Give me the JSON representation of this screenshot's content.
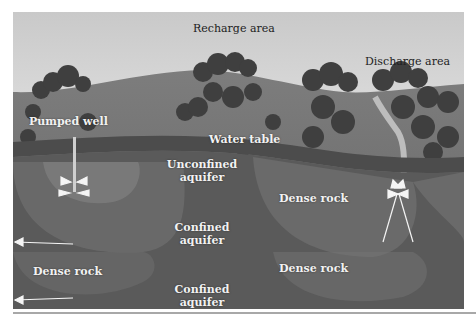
{
  "diagram": {
    "style": "grayscale illustration",
    "labels": {
      "recharge_area": "Recharge area",
      "discharge_area": "Discharge area",
      "pumped_well": "Pumped well",
      "water_table": "Water table",
      "unconfined_aquifer_line1": "Unconfined",
      "unconfined_aquifer_line2": "aquifer",
      "confined_aquifer_1_line1": "Confined",
      "confined_aquifer_1_line2": "aquifer",
      "confined_aquifer_2_line1": "Confined",
      "confined_aquifer_2_line2": "aquifer",
      "dense_rock_left": "Dense rock",
      "dense_rock_right_upper": "Dense rock",
      "dense_rock_right_lower": "Dense rock"
    },
    "colors": {
      "sky": "#dcdcdc",
      "hill": "#707070",
      "trees": "#3e3e3e",
      "soil": "#555555",
      "rock_dark": "#4a4a4a",
      "rock_light": "#7a7a7a",
      "arrows": "#f5f5f5"
    }
  }
}
